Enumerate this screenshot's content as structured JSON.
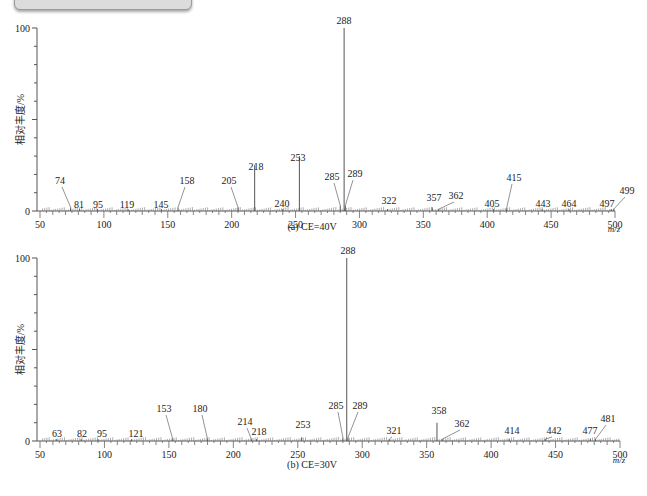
{
  "banner": {
    "title": ""
  },
  "chart_data": [
    {
      "type": "bar",
      "title": "",
      "caption": "(a) CE=40V",
      "xlabel": "m/z",
      "ylabel": "相对丰度/%",
      "xlim": [
        50,
        500
      ],
      "ylim": [
        0,
        100
      ],
      "x_ticks": [
        50,
        100,
        150,
        200,
        250,
        300,
        350,
        400,
        450,
        500
      ],
      "y_tick_labels": [
        "0",
        "100"
      ],
      "grid": false,
      "peaks": [
        {
          "mz": 74,
          "intensity": 2,
          "label": "74"
        },
        {
          "mz": 81,
          "intensity": 1,
          "label": "81"
        },
        {
          "mz": 95,
          "intensity": 1,
          "label": "95"
        },
        {
          "mz": 119,
          "intensity": 1,
          "label": "119"
        },
        {
          "mz": 145,
          "intensity": 1,
          "label": "145"
        },
        {
          "mz": 158,
          "intensity": 2,
          "label": "158"
        },
        {
          "mz": 205,
          "intensity": 2,
          "label": "205"
        },
        {
          "mz": 218,
          "intensity": 25,
          "label": "218"
        },
        {
          "mz": 240,
          "intensity": 1,
          "label": "240"
        },
        {
          "mz": 253,
          "intensity": 30,
          "label": "253"
        },
        {
          "mz": 285,
          "intensity": 3,
          "label": "285"
        },
        {
          "mz": 288,
          "intensity": 100,
          "label": "288"
        },
        {
          "mz": 289,
          "intensity": 3,
          "label": "289"
        },
        {
          "mz": 322,
          "intensity": 1,
          "label": "322"
        },
        {
          "mz": 357,
          "intensity": 2,
          "label": "357"
        },
        {
          "mz": 362,
          "intensity": 1,
          "label": "362"
        },
        {
          "mz": 405,
          "intensity": 1,
          "label": "405"
        },
        {
          "mz": 415,
          "intensity": 1,
          "label": "415"
        },
        {
          "mz": 443,
          "intensity": 1,
          "label": "443"
        },
        {
          "mz": 464,
          "intensity": 1,
          "label": "464"
        },
        {
          "mz": 497,
          "intensity": 1,
          "label": "497"
        },
        {
          "mz": 499,
          "intensity": 1,
          "label": "499"
        }
      ]
    },
    {
      "type": "bar",
      "title": "",
      "caption": "(b) CE=30V",
      "xlabel": "m/z",
      "ylabel": "相对丰度/%",
      "xlim": [
        50,
        500
      ],
      "ylim": [
        0,
        100
      ],
      "x_ticks": [
        50,
        100,
        150,
        200,
        250,
        300,
        350,
        400,
        450,
        500
      ],
      "y_tick_labels": [
        "0",
        "100"
      ],
      "grid": false,
      "peaks": [
        {
          "mz": 63,
          "intensity": 1,
          "label": "63"
        },
        {
          "mz": 82,
          "intensity": 1,
          "label": "82"
        },
        {
          "mz": 95,
          "intensity": 1,
          "label": "95"
        },
        {
          "mz": 121,
          "intensity": 1,
          "label": "121"
        },
        {
          "mz": 153,
          "intensity": 1,
          "label": "153"
        },
        {
          "mz": 180,
          "intensity": 1,
          "label": "180"
        },
        {
          "mz": 214,
          "intensity": 1,
          "label": "214"
        },
        {
          "mz": 218,
          "intensity": 1,
          "label": "218"
        },
        {
          "mz": 253,
          "intensity": 2,
          "label": "253"
        },
        {
          "mz": 285,
          "intensity": 2,
          "label": "285"
        },
        {
          "mz": 288,
          "intensity": 100,
          "label": "288"
        },
        {
          "mz": 289,
          "intensity": 2,
          "label": "289"
        },
        {
          "mz": 321,
          "intensity": 1,
          "label": "321"
        },
        {
          "mz": 358,
          "intensity": 10,
          "label": "358"
        },
        {
          "mz": 362,
          "intensity": 1,
          "label": "362"
        },
        {
          "mz": 414,
          "intensity": 1,
          "label": "414"
        },
        {
          "mz": 442,
          "intensity": 1,
          "label": "442"
        },
        {
          "mz": 477,
          "intensity": 1,
          "label": "477"
        },
        {
          "mz": 481,
          "intensity": 1,
          "label": "481"
        }
      ]
    }
  ],
  "label_layout": [
    {
      "x0": 40,
      "x1": 615,
      "y0": 211,
      "y100": 28,
      "caption_x": 312,
      "caption_y": 230,
      "xlabel_x": 614,
      "xlabel_y": 232,
      "labels": {
        "74": {
          "tx": 60,
          "ty": 184
        },
        "81": {
          "tx": 79,
          "ty": 208
        },
        "95": {
          "tx": 98,
          "ty": 208
        },
        "119": {
          "tx": 127,
          "ty": 208
        },
        "145": {
          "tx": 161,
          "ty": 208
        },
        "158": {
          "tx": 187,
          "ty": 184
        },
        "205": {
          "tx": 229,
          "ty": 184
        },
        "218": {
          "tx": 256,
          "ty": 170
        },
        "240": {
          "tx": 282,
          "ty": 207
        },
        "253": {
          "tx": 298,
          "ty": 161
        },
        "285": {
          "tx": 332,
          "ty": 180
        },
        "288": {
          "tx": 344,
          "ty": 24
        },
        "289": {
          "tx": 355,
          "ty": 177
        },
        "322": {
          "tx": 389,
          "ty": 204
        },
        "357": {
          "tx": 434,
          "ty": 201
        },
        "362": {
          "tx": 456,
          "ty": 199
        },
        "405": {
          "tx": 492,
          "ty": 207
        },
        "415": {
          "tx": 514,
          "ty": 181
        },
        "443": {
          "tx": 543,
          "ty": 207
        },
        "464": {
          "tx": 569,
          "ty": 207
        },
        "497": {
          "tx": 607,
          "ty": 207
        },
        "499": {
          "tx": 627,
          "ty": 194
        }
      }
    },
    {
      "x0": 40,
      "x1": 620,
      "y0": 441,
      "y100": 258,
      "caption_x": 312,
      "caption_y": 468,
      "xlabel_x": 619,
      "xlabel_y": 463,
      "labels": {
        "63": {
          "tx": 57,
          "ty": 437
        },
        "82": {
          "tx": 82,
          "ty": 437
        },
        "95": {
          "tx": 102,
          "ty": 437
        },
        "121": {
          "tx": 136,
          "ty": 437
        },
        "153": {
          "tx": 164,
          "ty": 412
        },
        "180": {
          "tx": 200,
          "ty": 412
        },
        "214": {
          "tx": 245,
          "ty": 425
        },
        "218": {
          "tx": 259,
          "ty": 435
        },
        "253": {
          "tx": 303,
          "ty": 428
        },
        "285": {
          "tx": 336,
          "ty": 409
        },
        "288": {
          "tx": 348,
          "ty": 254
        },
        "289": {
          "tx": 360,
          "ty": 409
        },
        "321": {
          "tx": 394,
          "ty": 434
        },
        "358": {
          "tx": 439,
          "ty": 414
        },
        "362": {
          "tx": 462,
          "ty": 427
        },
        "414": {
          "tx": 512,
          "ty": 434
        },
        "442": {
          "tx": 554,
          "ty": 434
        },
        "477": {
          "tx": 590,
          "ty": 434
        },
        "481": {
          "tx": 608,
          "ty": 422
        }
      }
    }
  ]
}
